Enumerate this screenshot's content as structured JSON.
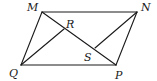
{
  "figure": {
    "shape": "parallelogram",
    "vertices": [
      "M",
      "N",
      "P",
      "Q"
    ],
    "points": {
      "M": "M",
      "N": "N",
      "P": "P",
      "Q": "Q",
      "R": "R",
      "S": "S"
    },
    "segments": [
      [
        "M",
        "N"
      ],
      [
        "N",
        "P"
      ],
      [
        "P",
        "Q"
      ],
      [
        "Q",
        "M"
      ],
      [
        "M",
        "P"
      ],
      [
        "Q",
        "R"
      ],
      [
        "N",
        "S"
      ]
    ],
    "stroke_color": "#1a1a1a"
  }
}
